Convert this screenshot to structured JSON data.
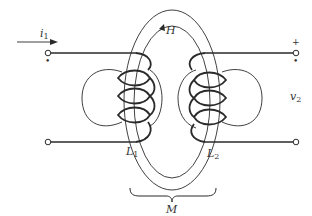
{
  "diagram": {
    "type": "mutual-inductance",
    "labels": {
      "current": {
        "symbol": "i",
        "sub": "1"
      },
      "field": "H",
      "voltage": {
        "symbol": "v",
        "sub": "2"
      },
      "inductor1": {
        "symbol": "L",
        "sub": "1"
      },
      "inductor2": {
        "symbol": "L",
        "sub": "2"
      },
      "mutual": "M",
      "plus": "+",
      "dot": "•"
    },
    "colors": {
      "stroke": "#2a2a2a",
      "text": "#333333",
      "background": "#ffffff"
    }
  }
}
